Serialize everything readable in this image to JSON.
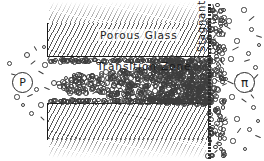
{
  "figure": {
    "background_color": "#ffffff",
    "ink_color": "#1b1b1b",
    "width": 264,
    "height": 161
  },
  "labels": {
    "porous_glass": "Porous   Glass",
    "transition_zone": "Transition  Zone",
    "stagnant_film": "Stagnant Film"
  },
  "symbols": {
    "left_pressure": "P",
    "right_osmotic": "π"
  },
  "regions": {
    "glass_top": {
      "name": "porous-glass-upper",
      "hatched": true
    },
    "glass_bottom": {
      "name": "porous-glass-lower",
      "hatched": true
    },
    "pore_gap": {
      "name": "transition-zone-gap"
    },
    "bulk_left": {
      "name": "bulk-solution-left"
    },
    "bulk_right": {
      "name": "bulk-solution-right"
    }
  },
  "particles": {
    "left_field": [
      {
        "x": 26,
        "y": 54,
        "r": 2.0
      },
      {
        "x": 44,
        "y": 64,
        "r": 1.6
      },
      {
        "x": 16,
        "y": 96,
        "r": 1.7
      },
      {
        "x": 35,
        "y": 88,
        "r": 1.5
      },
      {
        "x": 40,
        "y": 104,
        "r": 1.8
      },
      {
        "x": 30,
        "y": 112,
        "r": 1.5
      },
      {
        "x": 8,
        "y": 62,
        "r": 1.5
      },
      {
        "x": 43,
        "y": 46,
        "r": 1.4
      },
      {
        "x": 22,
        "y": 104,
        "r": 1.4
      }
    ],
    "left_dashes": [
      {
        "x": 30,
        "y": 62,
        "w": 6,
        "a": -38
      },
      {
        "x": 38,
        "y": 72,
        "w": 6,
        "a": 30
      },
      {
        "x": 20,
        "y": 84,
        "w": 6,
        "a": -52
      },
      {
        "x": 44,
        "y": 88,
        "w": 6,
        "a": 22
      },
      {
        "x": 33,
        "y": 48,
        "w": 5,
        "a": 58
      },
      {
        "x": 11,
        "y": 74,
        "w": 5,
        "a": 16
      },
      {
        "x": 27,
        "y": 95,
        "w": 6,
        "a": -24
      },
      {
        "x": 46,
        "y": 58,
        "w": 5,
        "a": -66
      },
      {
        "x": 40,
        "y": 118,
        "w": 5,
        "a": 44
      }
    ],
    "gap_density": "high",
    "right_field": [
      {
        "x": 214,
        "y": 12,
        "r": 1.9
      },
      {
        "x": 228,
        "y": 20,
        "r": 1.7
      },
      {
        "x": 243,
        "y": 9,
        "r": 1.6
      },
      {
        "x": 221,
        "y": 33,
        "r": 1.8
      },
      {
        "x": 236,
        "y": 40,
        "r": 1.6
      },
      {
        "x": 250,
        "y": 28,
        "r": 1.5
      },
      {
        "x": 212,
        "y": 50,
        "r": 1.7
      },
      {
        "x": 230,
        "y": 58,
        "r": 1.6
      },
      {
        "x": 247,
        "y": 52,
        "r": 1.5
      },
      {
        "x": 216,
        "y": 70,
        "r": 1.8
      },
      {
        "x": 238,
        "y": 76,
        "r": 1.6
      },
      {
        "x": 254,
        "y": 66,
        "r": 1.5
      },
      {
        "x": 213,
        "y": 88,
        "r": 1.7
      },
      {
        "x": 231,
        "y": 96,
        "r": 1.6
      },
      {
        "x": 249,
        "y": 88,
        "r": 1.5
      },
      {
        "x": 217,
        "y": 110,
        "r": 1.8
      },
      {
        "x": 236,
        "y": 118,
        "r": 1.6
      },
      {
        "x": 252,
        "y": 106,
        "r": 1.5
      },
      {
        "x": 214,
        "y": 130,
        "r": 1.7
      },
      {
        "x": 232,
        "y": 140,
        "r": 1.6
      },
      {
        "x": 248,
        "y": 128,
        "r": 1.5
      },
      {
        "x": 222,
        "y": 150,
        "r": 1.5
      },
      {
        "x": 244,
        "y": 148,
        "r": 1.4
      },
      {
        "x": 257,
        "y": 120,
        "r": 1.4
      },
      {
        "x": 258,
        "y": 44,
        "r": 1.4
      },
      {
        "x": 205,
        "y": 100,
        "r": 1.5
      }
    ],
    "right_dashes": [
      {
        "x": 248,
        "y": 18,
        "w": 7,
        "a": -40
      },
      {
        "x": 225,
        "y": 27,
        "w": 6,
        "a": 34
      },
      {
        "x": 256,
        "y": 36,
        "w": 6,
        "a": 18
      },
      {
        "x": 232,
        "y": 48,
        "w": 7,
        "a": -28
      },
      {
        "x": 219,
        "y": 62,
        "w": 6,
        "a": 48
      },
      {
        "x": 244,
        "y": 60,
        "w": 6,
        "a": -18
      },
      {
        "x": 227,
        "y": 82,
        "w": 7,
        "a": 26
      },
      {
        "x": 253,
        "y": 76,
        "w": 6,
        "a": -46
      },
      {
        "x": 241,
        "y": 100,
        "w": 6,
        "a": 36
      },
      {
        "x": 221,
        "y": 120,
        "w": 7,
        "a": -30
      },
      {
        "x": 255,
        "y": 136,
        "w": 6,
        "a": 24
      },
      {
        "x": 236,
        "y": 130,
        "w": 6,
        "a": -54
      },
      {
        "x": 210,
        "y": 42,
        "w": 5,
        "a": 60
      },
      {
        "x": 250,
        "y": 96,
        "w": 5,
        "a": 52
      }
    ]
  }
}
